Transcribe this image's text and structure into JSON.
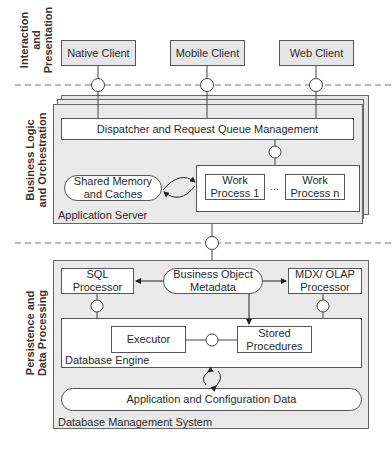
{
  "layers": {
    "interaction": "Interaction\nand\nPresentation",
    "interaction_lines": [
      "Interaction",
      "and",
      "Presentation"
    ],
    "business_lines": [
      "Business Logic",
      "and Orchestration"
    ],
    "persistence_lines": [
      "Persistence and",
      "Data Processing"
    ]
  },
  "clients": [
    {
      "label": "Native Client"
    },
    {
      "label": "Mobile Client"
    },
    {
      "label": "Web Client"
    }
  ],
  "application_server": {
    "label": "Application Server",
    "dispatcher": "Dispatcher and Request Queue Management",
    "shared_memory": {
      "line1": "Shared Memory",
      "line2": "and Caches"
    },
    "work_processes": [
      {
        "line1": "Work",
        "line2": "Process 1"
      },
      {
        "line1": "Work",
        "line2": "Process n"
      }
    ],
    "ellipsis": "..."
  },
  "dbms": {
    "label": "Database Management System",
    "sql_processor": {
      "line1": "SQL",
      "line2": "Processor"
    },
    "business_object_metadata": {
      "line1": "Business Object",
      "line2": "Metadata"
    },
    "mdx_olap_processor": {
      "line1": "MDX/ OLAP",
      "line2": "Processor"
    },
    "database_engine": {
      "label": "Database Engine",
      "executor": "Executor",
      "stored_procedures": {
        "line1": "Stored",
        "line2": "Procedures"
      }
    },
    "app_config_data": "Application and Configuration Data"
  },
  "colors": {
    "line": "#555555",
    "container_fill": "#e9e9e9",
    "client_fill": "#e6e6e6",
    "box_fill": "#ffffff"
  }
}
